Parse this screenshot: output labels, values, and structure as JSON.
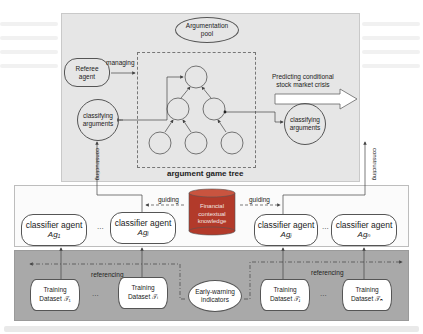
{
  "diagram": {
    "top_panel": {
      "argumentation_pool": {
        "line1": "Argumentation",
        "line2": "pool"
      },
      "referee_agent": {
        "line1": "Referee",
        "line2": "agent"
      },
      "managing_label": "managing",
      "classifying_left": {
        "line1": "classifying",
        "line2": "arguments"
      },
      "classifying_right": {
        "line1": "classifying",
        "line2": "arguments"
      },
      "tree_label": "argument game tree",
      "prediction_label": {
        "line1": "Predicting conditional",
        "line2": "stock market crisis"
      },
      "constructing_left": "constructing",
      "constructing_right": "constructing"
    },
    "middle_panel": {
      "agents": [
        {
          "title": "classifier agent",
          "subscript_label": "Ag₁"
        },
        {
          "title": "classifier agent",
          "subscript_label": "Agᵢ"
        },
        {
          "title": "classifier agent",
          "subscript_label": "Agⱼ"
        },
        {
          "title": "classifier agent",
          "subscript_label": "Agₙ"
        }
      ],
      "ellipsis": "...",
      "knowledge": {
        "line1": "Financial",
        "line2": "contextual",
        "line3": "knowledge"
      },
      "guiding_left": "guiding",
      "guiding_right": "guiding"
    },
    "bottom_panel": {
      "datasets": [
        {
          "line1": "Training",
          "line2": "Dataset 𝒯₁"
        },
        {
          "line1": "Training",
          "line2": "Dataset 𝒯ᵢ"
        },
        {
          "line1": "Training",
          "line2": "Dataset 𝒯ⱼ"
        },
        {
          "line1": "Training",
          "line2": "Dataset 𝒯ₙ"
        }
      ],
      "ellipsis": "...",
      "indicators": {
        "line1": "Early-warning",
        "line2": "indicators"
      },
      "referencing_left": "referencing",
      "referencing_right": "referencing"
    },
    "colors": {
      "top_panel_bg": "#e6e6e6",
      "bottom_panel_bg": "#a9a9a9",
      "knowledge_cylinder": "#b23a2a",
      "knowledge_top": "#c9543f",
      "line": "#444444"
    }
  }
}
